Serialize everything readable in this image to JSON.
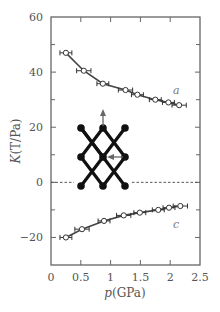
{
  "chart_data": {
    "type": "scatter",
    "title": "",
    "xlabel": "p(GPa)",
    "ylabel": "K(T/Pa)",
    "xlim": [
      0,
      2.5
    ],
    "ylim": [
      -30,
      60
    ],
    "xticks": [
      0,
      0.5,
      1,
      1.5,
      2,
      2.5
    ],
    "xtick_labels": [
      "0",
      "0.5",
      "1",
      "1.5",
      "2",
      "2.5"
    ],
    "yticks": [
      -20,
      0,
      20,
      40,
      60
    ],
    "ytick_labels": [
      "−20",
      "0",
      "20",
      "40",
      "60"
    ],
    "ytick_minor": [
      -30,
      -10,
      10,
      30,
      50
    ],
    "grid": false,
    "reference_line": {
      "y": 0,
      "style": "dashed"
    },
    "series": [
      {
        "name": "a",
        "marker": "open-circle",
        "with_fit_line": true,
        "x": [
          0.25,
          0.55,
          0.87,
          1.25,
          1.45,
          1.75,
          1.97,
          2.15
        ],
        "y": [
          47,
          40.5,
          35.8,
          33.5,
          31.8,
          30,
          29,
          28
        ],
        "x_error": [
          0.1,
          0.12,
          0.1,
          0.12,
          0.1,
          0.1,
          0.1,
          0.12
        ]
      },
      {
        "name": "c",
        "marker": "open-circle",
        "with_fit_line": true,
        "x": [
          0.25,
          0.52,
          0.89,
          1.22,
          1.49,
          1.8,
          1.98,
          2.17
        ],
        "y": [
          -20,
          -17,
          -14,
          -12,
          -11,
          -10,
          -9.2,
          -8.6
        ],
        "x_error": [
          0.1,
          0.12,
          0.1,
          0.12,
          0.1,
          0.1,
          0.1,
          0.12
        ]
      }
    ],
    "annotations": [
      {
        "text": "a",
        "x": 2.0,
        "y": 33.5
      },
      {
        "text": "c",
        "x": 2.0,
        "y": -15
      }
    ],
    "inset": {
      "description": "lattice diagram: diamond/rhombic network with filled nodes, arrow up at top-center node, arrow left at center node",
      "nodes_rows": 3,
      "nodes_cols": 3
    }
  }
}
